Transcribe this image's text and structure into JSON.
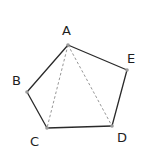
{
  "figure": {
    "type": "geometry-pentagon",
    "vertices": [
      {
        "id": "A",
        "label": "A"
      },
      {
        "id": "B",
        "label": "B"
      },
      {
        "id": "C",
        "label": "C"
      },
      {
        "id": "D",
        "label": "D"
      },
      {
        "id": "E",
        "label": "E"
      }
    ],
    "edges": [
      {
        "from": "A",
        "to": "B",
        "style": "solid"
      },
      {
        "from": "B",
        "to": "C",
        "style": "solid"
      },
      {
        "from": "C",
        "to": "D",
        "style": "solid"
      },
      {
        "from": "D",
        "to": "E",
        "style": "solid"
      },
      {
        "from": "E",
        "to": "A",
        "style": "solid"
      }
    ],
    "diagonals": [
      {
        "from": "A",
        "to": "C",
        "style": "dashed"
      },
      {
        "from": "A",
        "to": "D",
        "style": "dashed"
      }
    ],
    "colors": {
      "edge": "#2a2a2a",
      "diagonal": "#8a8a8a",
      "vertex": "#9a9a9a",
      "label": "#1e1e1e"
    }
  }
}
